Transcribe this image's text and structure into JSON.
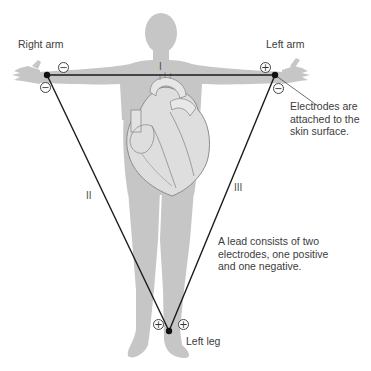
{
  "diagram": {
    "type": "einthoven-triangle-limb-leads",
    "colors": {
      "body_silhouette": "#c4c4c4",
      "heart_fill": "#d9d9d9",
      "heart_outline": "#8a8a8a",
      "lead_line": "#1a1a1a",
      "text": "#3c3c3c",
      "background": "#ffffff"
    },
    "limb_labels": {
      "right_arm": "Right arm",
      "left_arm": "Left arm",
      "left_leg": "Left leg"
    },
    "leads": [
      {
        "name": "I",
        "from": "Right arm (−)",
        "to": "Left arm (+)"
      },
      {
        "name": "II",
        "from": "Right arm (−)",
        "to": "Left leg (+)"
      },
      {
        "name": "III",
        "from": "Left arm (−)",
        "to": "Left leg (+)"
      }
    ],
    "lead_labels": {
      "lead_i": "I",
      "lead_ii": "II",
      "lead_iii": "III"
    },
    "polarity_marks": {
      "right_arm_lead_i": "−",
      "right_arm_lead_ii": "−",
      "left_arm_lead_i": "+",
      "left_arm_lead_iii": "−",
      "left_leg_lead_ii": "+",
      "left_leg_lead_iii": "+"
    },
    "annotations": {
      "electrodes_note": "Electrodes are attached to the skin surface.",
      "lead_note": "A lead consists of two electrodes, one positive and one negative."
    }
  }
}
